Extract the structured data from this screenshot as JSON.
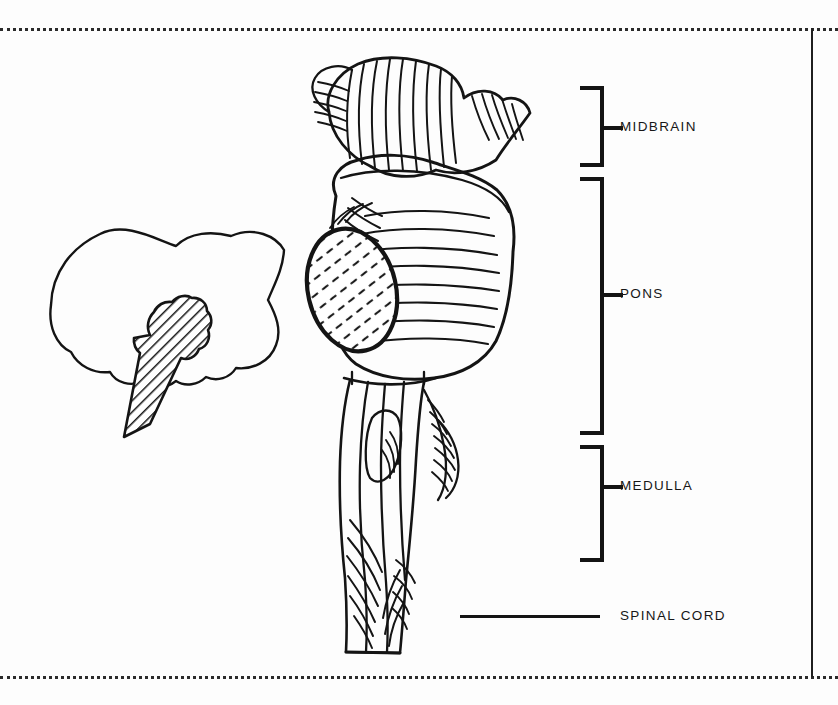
{
  "figure": {
    "background_color": "#fdfdfd",
    "ink_color": "#141414"
  },
  "frame": {
    "top_rule_style": "dotted",
    "bottom_rule_style": "dotted",
    "right_rule_style": "solid",
    "rule_color": "#2b2b2b"
  },
  "inset": {
    "name": "brain-outline-inset",
    "description": "Lateral brain silhouette with hatched brainstem highlight",
    "hatch_color": "#141414"
  },
  "callouts": [
    {
      "id": "midbrain",
      "label": "MIDBRAIN",
      "marker": "bracket",
      "bracket_top": 86,
      "bracket_bottom": 167,
      "tick_y": 126,
      "label_x": 620,
      "label_y": 120
    },
    {
      "id": "pons",
      "label": "PONS",
      "marker": "bracket",
      "bracket_top": 177,
      "bracket_bottom": 435,
      "tick_y": 293,
      "label_x": 620,
      "label_y": 287
    },
    {
      "id": "medulla",
      "label": "MEDULLA",
      "marker": "bracket",
      "bracket_top": 445,
      "bracket_bottom": 562,
      "tick_y": 485,
      "label_x": 620,
      "label_y": 479
    },
    {
      "id": "spinal-cord",
      "label": "SPINAL CORD",
      "marker": "line",
      "line_x1": 460,
      "line_x2": 600,
      "line_y": 615,
      "label_x": 620,
      "label_y": 609
    }
  ]
}
